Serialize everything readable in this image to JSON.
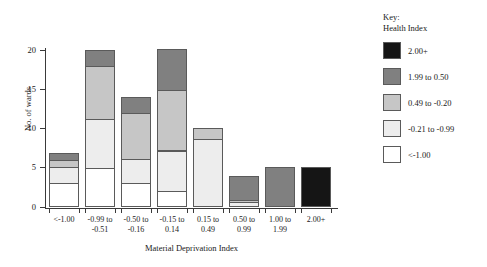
{
  "chart_data": {
    "type": "bar",
    "title": "",
    "subtitle": "",
    "xlabel": "Material Deprivation Index",
    "ylabel": "No. of wards",
    "ylim": [
      0,
      20
    ],
    "y_ticks": [
      0,
      5,
      10,
      15,
      20
    ],
    "grid": false,
    "stacked": true,
    "legend_position": "right",
    "legend_title_lines": [
      "Key:",
      "Health Index"
    ],
    "categories": [
      "<-1.00",
      "-0.99 to\n-0.51",
      "-0.50 to\n-0.16",
      "-0.15 to\n0.14",
      "0.15 to\n0.49",
      "0.50 to\n0.99",
      "1.00 to\n1.99",
      "2.00+"
    ],
    "series": [
      {
        "name": "<-1.00",
        "color": "#ffffff",
        "values": [
          3.0,
          5.0,
          3.0,
          2.0,
          0.0,
          0.0,
          0.0,
          0.0
        ]
      },
      {
        "name": "-0.21 to -0.99",
        "color": "#ededed",
        "values": [
          2.2,
          6.3,
          3.2,
          5.3,
          8.7,
          0.6,
          0.0,
          0.0
        ]
      },
      {
        "name": "0.49 to -0.20",
        "color": "#c6c6c6",
        "values": [
          1.0,
          6.9,
          6.0,
          7.8,
          1.5,
          0.4,
          0.0,
          0.0
        ]
      },
      {
        "name": "1.99 to 0.50",
        "color": "#808080",
        "values": [
          1.0,
          2.1,
          2.1,
          5.3,
          0.0,
          3.1,
          5.1,
          0.0
        ]
      },
      {
        "name": "2.00+",
        "color": "#151515",
        "values": [
          0.0,
          0.0,
          0.0,
          0.0,
          0.0,
          0.0,
          0.0,
          5.1
        ]
      }
    ],
    "totals": [
      7.2,
      20.3,
      14.3,
      20.4,
      10.2,
      4.1,
      5.1,
      5.1
    ],
    "legend_entries": [
      {
        "label": "2.00+",
        "color": "#151515"
      },
      {
        "label": "1.99 to 0.50",
        "color": "#808080"
      },
      {
        "label": "0.49 to -0.20",
        "color": "#c6c6c6"
      },
      {
        "label": "-0.21 to -0.99",
        "color": "#ededed"
      },
      {
        "label": "<-1.00",
        "color": "#ffffff"
      }
    ]
  }
}
